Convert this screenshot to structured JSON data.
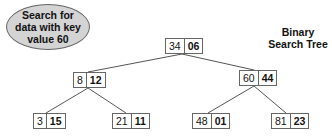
{
  "callout": {
    "lines": [
      "Search for",
      "data with key",
      "value 60"
    ]
  },
  "title": {
    "lines": [
      "Binary",
      "Search Tree"
    ]
  },
  "nodes": {
    "root": {
      "key": "34",
      "data": "06"
    },
    "l": {
      "key": "8",
      "data": "12"
    },
    "r": {
      "key": "60",
      "data": "44"
    },
    "ll": {
      "key": "3",
      "data": "15"
    },
    "lr": {
      "key": "21",
      "data": "11"
    },
    "rl": {
      "key": "48",
      "data": "01"
    },
    "rr": {
      "key": "81",
      "data": "23"
    }
  },
  "colors": {
    "callout_fill": "#d4d4d4",
    "border": "#666666",
    "edge": "#555555"
  }
}
